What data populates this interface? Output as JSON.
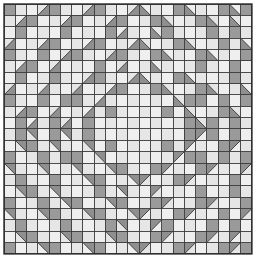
{
  "document": {
    "title": "Quilt Block Pattern Diagram",
    "kind": "patchwork-quilt-diagram"
  },
  "canvas": {
    "width": 260,
    "height": 266,
    "background_color": "#ffffff"
  },
  "grid": {
    "columns": 22,
    "rows": 22,
    "origin_x": 4,
    "origin_y": 4,
    "cell_width": 11.27,
    "cell_height": 11.36,
    "line_color": "#3a3a3a",
    "line_width": 0.9,
    "outer_border_color": "#2b2b2b",
    "outer_border_width": 1.4
  },
  "palette": {
    "light": "#efefef",
    "light_alt": "#e6e6e6",
    "shade": "#9a9a9a",
    "shade_alt": "#8f8f8f",
    "line": "#3a3a3a",
    "background": "#ffffff"
  },
  "legend": {
    "light_label": "background fabric",
    "shade_label": "feature fabric"
  },
  "pattern": {
    "description": "Concentric diamond medallion built from plain squares and half-square triangles, four-fold symmetric",
    "symmetry": "4-fold (horizontal, vertical and diagonal mirror)",
    "unit": "half-square-triangle",
    "triangle_codes": {
      "0": "plain light square",
      "1": "plain shaded square",
      "tl": "shaded triangle in top-left corner",
      "tr": "shaded triangle in top-right corner",
      "bl": "shaded triangle in bottom-left corner",
      "br": "shaded triangle in bottom-right corner"
    },
    "cells": [
      [
        "1",
        "0",
        "0",
        "br",
        "1",
        "0",
        "0",
        "br",
        "1",
        "0",
        "0",
        "br",
        "bl",
        "0",
        "0",
        "1",
        "bl",
        "0",
        "0",
        "1",
        "bl",
        "1"
      ],
      [
        "0",
        "br",
        "1",
        "0",
        "0",
        "br",
        "1",
        "0",
        "0",
        "br",
        "1",
        "0",
        "0",
        "1",
        "bl",
        "0",
        "0",
        "1",
        "bl",
        "0",
        "bl",
        "0"
      ],
      [
        "0",
        "1",
        "0",
        "0",
        "0",
        "1",
        "0",
        "0",
        "0",
        "1",
        "br",
        "0",
        "0",
        "bl",
        "1",
        "0",
        "0",
        "0",
        "1",
        "0",
        "1",
        "0"
      ],
      [
        "br",
        "0",
        "0",
        "br",
        "1",
        "0",
        "0",
        "br",
        "1",
        "0",
        "0",
        "br",
        "bl",
        "0",
        "0",
        "1",
        "bl",
        "0",
        "0",
        "1",
        "0",
        "bl"
      ],
      [
        "1",
        "0",
        "0",
        "1",
        "0",
        "br",
        "1",
        "0",
        "0",
        "br",
        "1",
        "0",
        "0",
        "1",
        "bl",
        "0",
        "0",
        "1",
        "bl",
        "0",
        "0",
        "1"
      ],
      [
        "0",
        "br",
        "1",
        "0",
        "br",
        "0",
        "0",
        "0",
        "1",
        "0",
        "br",
        "0",
        "0",
        "bl",
        "0",
        "0",
        "0",
        "1",
        "0",
        "0",
        "1",
        "0"
      ],
      [
        "0",
        "1",
        "0",
        "0",
        "1",
        "0",
        "0",
        "br",
        "1",
        "0",
        "0",
        "br",
        "bl",
        "0",
        "0",
        "1",
        "bl",
        "0",
        "0",
        "0",
        "1",
        "0"
      ],
      [
        "br",
        "0",
        "0",
        "br",
        "0",
        "0",
        "br",
        "0",
        "0",
        "br",
        "1",
        "0",
        "0",
        "1",
        "bl",
        "0",
        "0",
        "1",
        "bl",
        "0",
        "0",
        "bl"
      ],
      [
        "1",
        "0",
        "0",
        "1",
        "0",
        "1",
        "1",
        "0",
        "br",
        "0",
        "0",
        "0",
        "0",
        "0",
        "0",
        "bl",
        "1",
        "1",
        "0",
        "1",
        "0",
        "1"
      ],
      [
        "0",
        "br",
        "1",
        "0",
        "br",
        "0",
        "0",
        "br",
        "0",
        "1",
        "0",
        "0",
        "0",
        "0",
        "1",
        "0",
        "bl",
        "0",
        "0",
        "1",
        "bl",
        "0"
      ],
      [
        "0",
        "1",
        "br",
        "0",
        "1",
        "br",
        "0",
        "1",
        "0",
        "0",
        "0",
        "0",
        "0",
        "0",
        "0",
        "0",
        "1",
        "bl",
        "1",
        "0",
        "1",
        "0"
      ],
      [
        "0",
        "1",
        "tr",
        "0",
        "1",
        "tr",
        "0",
        "1",
        "0",
        "0",
        "0",
        "0",
        "0",
        "0",
        "0",
        "0",
        "1",
        "tl",
        "1",
        "0",
        "1",
        "0"
      ],
      [
        "0",
        "tr",
        "1",
        "0",
        "tr",
        "0",
        "0",
        "tr",
        "0",
        "1",
        "0",
        "0",
        "0",
        "0",
        "1",
        "0",
        "tl",
        "0",
        "0",
        "1",
        "tl",
        "0"
      ],
      [
        "1",
        "0",
        "0",
        "1",
        "0",
        "1",
        "1",
        "0",
        "tr",
        "0",
        "0",
        "0",
        "0",
        "0",
        "0",
        "tl",
        "1",
        "1",
        "0",
        "1",
        "0",
        "1"
      ],
      [
        "tr",
        "0",
        "0",
        "tr",
        "0",
        "0",
        "tr",
        "0",
        "0",
        "tr",
        "1",
        "0",
        "0",
        "1",
        "tl",
        "0",
        "0",
        "1",
        "tl",
        "0",
        "0",
        "tl"
      ],
      [
        "0",
        "1",
        "0",
        "0",
        "1",
        "0",
        "0",
        "tr",
        "1",
        "0",
        "0",
        "tr",
        "tl",
        "0",
        "0",
        "1",
        "tl",
        "0",
        "0",
        "0",
        "1",
        "0"
      ],
      [
        "0",
        "tr",
        "1",
        "0",
        "tr",
        "0",
        "0",
        "0",
        "1",
        "0",
        "tr",
        "0",
        "0",
        "tl",
        "0",
        "0",
        "0",
        "1",
        "0",
        "0",
        "1",
        "0"
      ],
      [
        "1",
        "0",
        "0",
        "1",
        "0",
        "tr",
        "1",
        "0",
        "0",
        "tr",
        "1",
        "0",
        "0",
        "1",
        "tl",
        "0",
        "0",
        "1",
        "tl",
        "0",
        "0",
        "1"
      ],
      [
        "tr",
        "0",
        "0",
        "tr",
        "1",
        "0",
        "0",
        "tr",
        "1",
        "0",
        "0",
        "tr",
        "tl",
        "0",
        "0",
        "1",
        "tl",
        "0",
        "0",
        "1",
        "0",
        "tl"
      ],
      [
        "0",
        "1",
        "0",
        "0",
        "0",
        "1",
        "0",
        "0",
        "0",
        "1",
        "tr",
        "0",
        "0",
        "tl",
        "1",
        "0",
        "0",
        "0",
        "1",
        "0",
        "1",
        "0"
      ],
      [
        "0",
        "tr",
        "1",
        "0",
        "0",
        "tr",
        "1",
        "0",
        "0",
        "tr",
        "1",
        "0",
        "0",
        "1",
        "tl",
        "0",
        "0",
        "1",
        "tl",
        "0",
        "tl",
        "0"
      ],
      [
        "1",
        "0",
        "0",
        "tr",
        "1",
        "0",
        "0",
        "tr",
        "1",
        "0",
        "0",
        "tr",
        "tl",
        "0",
        "0",
        "1",
        "tl",
        "0",
        "0",
        "1",
        "tl",
        "1"
      ]
    ]
  }
}
